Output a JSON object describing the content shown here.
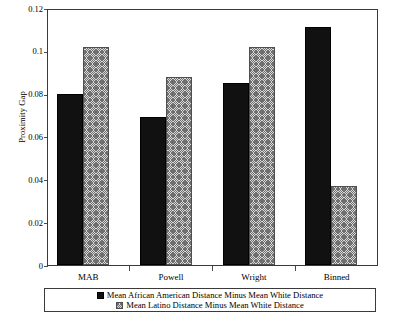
{
  "chart_data": {
    "type": "bar",
    "title": "",
    "subtitle": "",
    "xlabel": "",
    "ylabel": "Proximity Gap",
    "categories": [
      "MAB",
      "Powell",
      "Wright",
      "Binned"
    ],
    "series": [
      {
        "name": "Mean African American Distance Minus Mean White Distance",
        "values": [
          0.08,
          0.069,
          0.085,
          0.111
        ],
        "color": "#111111",
        "fill": "solid-black"
      },
      {
        "name": "Mean Latino Distance Minus Mean White Distance",
        "values": [
          0.102,
          0.088,
          0.102,
          0.037
        ],
        "color": "#d9d9d9",
        "fill": "diagonal-crosshatch"
      }
    ],
    "ylim": [
      0,
      0.12
    ],
    "yticks": [
      0,
      0.02,
      0.04,
      0.06,
      0.08,
      0.1,
      0.12
    ],
    "ytick_labels": [
      "0",
      "0.02",
      "0.04",
      "0.06",
      "0.08",
      "0.1",
      "0.12"
    ],
    "grid": false,
    "legend_position": "bottom",
    "frame": "box"
  },
  "axes": {
    "y_title": "Proximity Gap",
    "y_tick_labels": [
      "0.12",
      "0.1",
      "0.08",
      "0.06",
      "0.04",
      "0.02",
      "0"
    ],
    "x_tick_labels": [
      "MAB",
      "Powell",
      "Wright",
      "Binned"
    ]
  },
  "legend": {
    "entries": [
      {
        "label": "Mean African American Distance Minus Mean White Distance",
        "swatch": "solid-black-swatch"
      },
      {
        "label": "Mean Latino Distance Minus Mean White Distance",
        "swatch": "hatched-swatch"
      }
    ]
  }
}
